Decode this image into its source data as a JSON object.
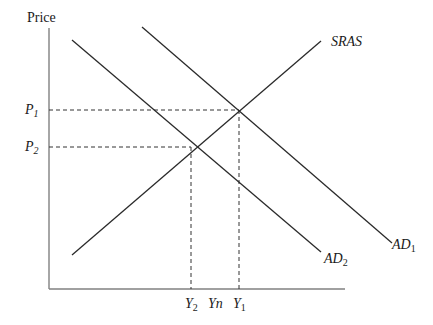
{
  "diagram": {
    "y_axis_label": "Price",
    "price_labels": [
      {
        "id": "P1",
        "base": "P",
        "sub": "1",
        "y": 110
      },
      {
        "id": "P2",
        "base": "P",
        "sub": "2",
        "y": 147
      }
    ],
    "output_labels": [
      {
        "id": "Y2",
        "base": "Y",
        "sub": "2",
        "x": 191
      },
      {
        "id": "Yn",
        "base": "Yn",
        "sub": "",
        "x": 215
      },
      {
        "id": "Y1",
        "base": "Y",
        "sub": "1",
        "x": 239
      }
    ],
    "curves": [
      {
        "id": "SRAS",
        "label": "SRAS",
        "label_sub": "",
        "x1": 72,
        "y1": 255,
        "x2": 321,
        "y2": 41
      },
      {
        "id": "AD1",
        "label": "AD",
        "label_sub": "1",
        "x1": 142,
        "y1": 27,
        "x2": 392,
        "y2": 243
      },
      {
        "id": "AD2",
        "label": "AD",
        "label_sub": "2",
        "x1": 72,
        "y1": 40,
        "x2": 321,
        "y2": 252
      }
    ],
    "equilibria": [
      {
        "id": "E1",
        "x": 239,
        "y": 110
      },
      {
        "id": "E2",
        "x": 191,
        "y": 147
      }
    ],
    "colors": {
      "axis": "#808080",
      "curve": "#2a2a2a",
      "text": "#1a1a1a"
    }
  }
}
